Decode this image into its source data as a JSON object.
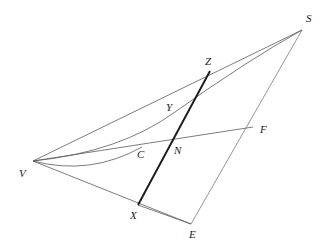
{
  "figure": {
    "type": "geometry-diagram",
    "title": "",
    "background_color": "#ffffff",
    "line_color": "#555555",
    "emphasis_color": "#1a1a1a",
    "label_color": "#1a1a1a",
    "width": 328,
    "height": 251
  },
  "points": {
    "S": {
      "label": "S",
      "x": 302,
      "y": 30,
      "label_x": 306,
      "label_y": 13
    },
    "V": {
      "label": "V",
      "x": 33,
      "y": 161,
      "label_x": 19,
      "label_y": 168
    },
    "Z": {
      "label": "Z",
      "x": 210,
      "y": 71,
      "label_x": 205,
      "label_y": 56
    },
    "Y": {
      "label": "Y",
      "x": 173,
      "y": 116,
      "label_x": 166,
      "label_y": 102
    },
    "N": {
      "label": "N",
      "x": 179,
      "y": 146,
      "label_x": 174,
      "label_y": 145
    },
    "C": {
      "label": "C",
      "x": 142,
      "y": 147,
      "label_x": 137,
      "label_y": 149
    },
    "F": {
      "label": "F",
      "x": 253,
      "y": 127,
      "label_x": 260,
      "label_y": 124
    },
    "X": {
      "label": "X",
      "x": 138,
      "y": 205,
      "label_x": 130,
      "label_y": 210
    },
    "E": {
      "label": "E",
      "x": 191,
      "y": 224,
      "label_x": 189,
      "label_y": 229
    }
  },
  "segments": [
    {
      "name": "segment-V-S",
      "from": "V",
      "to": "S",
      "style": "thin"
    },
    {
      "name": "segment-V-F",
      "from": "V",
      "to": "F",
      "style": "thin"
    },
    {
      "name": "segment-V-E",
      "from": "V",
      "to": "E",
      "style": "thin"
    },
    {
      "name": "segment-S-E",
      "from": "S",
      "to": "E",
      "style": "thin"
    },
    {
      "name": "segment-X-E",
      "from": "X",
      "to": "E",
      "style": "thin"
    },
    {
      "name": "segment-X-Z",
      "from": "X",
      "to": "Z",
      "style": "thick"
    }
  ],
  "curves": [
    {
      "name": "curve-V-S",
      "from": "V",
      "to": "S",
      "through": "C",
      "style": "thin"
    },
    {
      "name": "curve-V-arc-lower",
      "from": "V",
      "to": "C",
      "style": "thin"
    }
  ],
  "labels_order": [
    "S",
    "Z",
    "Y",
    "F",
    "N",
    "C",
    "V",
    "X",
    "E"
  ]
}
